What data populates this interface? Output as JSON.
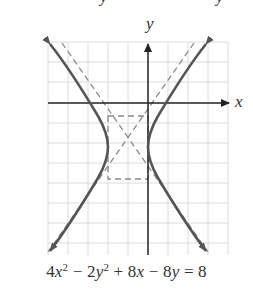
{
  "figure": {
    "axis_labels": {
      "x": "x",
      "y": "y"
    },
    "clipped_top_text": [
      "y",
      "y"
    ],
    "equation": {
      "full": "4x² − 2y² + 8x − 8y = 8",
      "parts": {
        "c1": "4",
        "v1": "x",
        "e1": "2",
        "op1": " − 2",
        "v2": "y",
        "e2": "2",
        "op2": " + 8",
        "v3": "x",
        "op3": " − 8",
        "v4": "y",
        "rhs": " = 8"
      }
    },
    "standard_form": "(x+1)² − (y+2)²/2 = 1",
    "center": [
      -1,
      -2
    ],
    "a": 1,
    "b": 1.414,
    "vertices": [
      [
        0,
        -2
      ],
      [
        -2,
        -2
      ]
    ],
    "asymptotes": [
      "y + 2 = √2 (x + 1)",
      "y + 2 = −√2 (x + 1)"
    ],
    "grid": {
      "x_min": -5,
      "x_max": 4,
      "y_min": -8,
      "y_max": 3,
      "unit_px": 20
    },
    "colors": {
      "curve": "#555555",
      "asymptote": "#888888",
      "grid": "#dddddd",
      "axis": "#333333"
    }
  }
}
